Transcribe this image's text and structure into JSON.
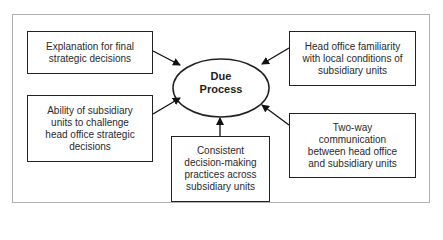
{
  "diagram": {
    "type": "hub-and-spoke",
    "center": {
      "label_line1": "Due",
      "label_line2": "Process",
      "shape": "ellipse"
    },
    "nodes": [
      {
        "id": "explanation",
        "label": "Explanation for final strategic decisions",
        "position": "top-left"
      },
      {
        "id": "ability",
        "label": "Ability of subsidiary units to challenge head office strategic decisions",
        "position": "middle-left"
      },
      {
        "id": "consistent",
        "label": "Consistent decision-making practices across subsidiary units",
        "position": "bottom-center"
      },
      {
        "id": "two-way",
        "label": "Two-way communication between head office and subsidiary units",
        "position": "middle-right"
      },
      {
        "id": "familiarity",
        "label": "Head office familiarity with local conditions of subsidiary units",
        "position": "top-right"
      }
    ],
    "edges": [
      {
        "from": "explanation",
        "to": "center"
      },
      {
        "from": "ability",
        "to": "center"
      },
      {
        "from": "consistent",
        "to": "center"
      },
      {
        "from": "two-way",
        "to": "center"
      },
      {
        "from": "familiarity",
        "to": "center"
      }
    ],
    "colors": {
      "stroke": "#222222",
      "frame": "#b0b0b0",
      "text": "#2a2a2a",
      "background": "#ffffff"
    }
  }
}
